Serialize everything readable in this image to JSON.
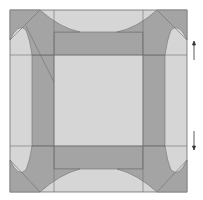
{
  "diagram": {
    "type": "quilt-block-pattern",
    "colors": {
      "background": "#ffffff",
      "light": "#d6d6d6",
      "dark": "#a4a4a4",
      "line": "#6e6e6e",
      "arrow": "#333333"
    },
    "arrows": [
      {
        "direction": "up"
      },
      {
        "direction": "down"
      }
    ]
  }
}
